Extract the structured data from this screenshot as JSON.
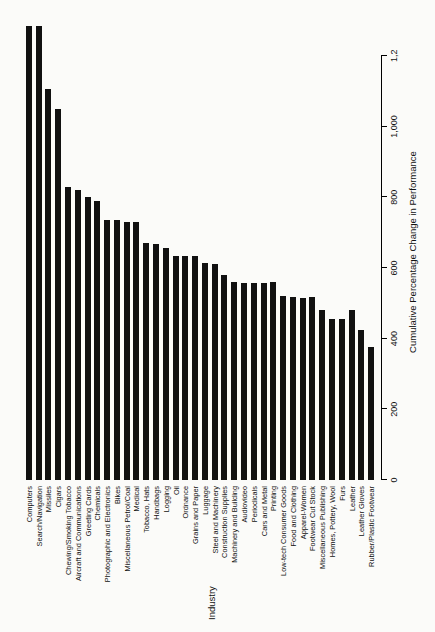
{
  "chart_data": {
    "type": "bar",
    "orientation": "vertical-rotated",
    "title": "",
    "xlabel": "Industry",
    "ylabel": "Cumulative Percentage Change in Performance",
    "ylim": [
      0,
      1290
    ],
    "ytick_labels": [
      "0",
      "200",
      "400",
      "600",
      "800",
      "1,000",
      "1,2"
    ],
    "ytick_values": [
      0,
      200,
      400,
      600,
      800,
      1000,
      1200
    ],
    "grid": false,
    "legend": null,
    "categories": [
      "Computers",
      "Search/Navigation",
      "Missiles",
      "Cigars",
      "Chewing/Smoking Tobacco",
      "Aircraft and Communications",
      "Greeting Cards",
      "Chemicals",
      "Photographic and Electronics",
      "Bikes",
      "Miscellaneous Petrol/Coal",
      "Medical",
      "Tobacco, Hats",
      "Handbags",
      "Logging",
      "Oil",
      "Ordnance",
      "Grains and Paper",
      "Luggage",
      "Steel and Machinery",
      "Construction Supplies",
      "Machinery and Building",
      "Audiovideo",
      "Periodicals",
      "Cars and Metal",
      "Printing",
      "Low-tech Consumer Goods",
      "Food and Clothing",
      "Apparel-Women",
      "Footwear Cut Stock",
      "Miscellaneous Publishing",
      "Homes, Pottery, Wool",
      "Furs",
      "Leather",
      "Leather Gloves",
      "Rubber/Plastic Footwear"
    ],
    "values": [
      1285,
      1285,
      1105,
      1050,
      830,
      820,
      800,
      790,
      735,
      735,
      730,
      730,
      670,
      668,
      655,
      635,
      635,
      635,
      615,
      612,
      580,
      560,
      558,
      558,
      558,
      560,
      520,
      518,
      515,
      518,
      480,
      455,
      455,
      480,
      425,
      375
    ]
  }
}
